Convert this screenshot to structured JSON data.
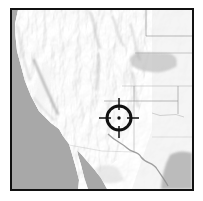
{
  "map": {
    "description": "Shaded relief map of the western United States with a crosshair target marker over the southern Utah / northern Arizona region",
    "marker": {
      "shape": "crosshair-circle",
      "color": "#111111",
      "x": 107,
      "y": 108,
      "transform": "translate(107,108)"
    },
    "colors": {
      "background": "#ffffff",
      "frame": "#111111",
      "ocean": "#a8a8a8",
      "land": "#e9e9e9",
      "highland_shade": "#c6c6c6",
      "lowland_shade": "#b5b5b5",
      "state_lines": "#8f8f8f"
    }
  }
}
